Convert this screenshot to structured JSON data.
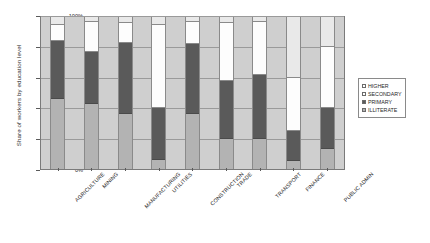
{
  "chart_data": {
    "type": "bar",
    "subtype": "stacked-percentage",
    "title": "",
    "xlabel": "",
    "ylabel": "Share of workers by education level",
    "ylim": [
      0,
      100
    ],
    "yticks": [
      "0%",
      "20%",
      "40%",
      "60%",
      "80%",
      "100%"
    ],
    "grid": true,
    "legend_position": "right",
    "categories": [
      "AGRICULTURE",
      "MINING",
      "MANUFACTURING",
      "UTILITIES",
      "CONSTRUCTION",
      "TRADE",
      "TRANSPORT",
      "FINANCE",
      "PUBLIC ADMIN"
    ],
    "series": [
      {
        "name": "ILLITERATE",
        "color": "#b3b3b3",
        "values": [
          46,
          43,
          36,
          6,
          36,
          20,
          20,
          5,
          13
        ]
      },
      {
        "name": "PRIMARY",
        "color": "#5a5a5a",
        "values": [
          38,
          34,
          47,
          34,
          46,
          38,
          42,
          20,
          27
        ]
      },
      {
        "name": "SECONDARY",
        "color": "#fdfdfd",
        "values": [
          11,
          20,
          13,
          55,
          15,
          38,
          35,
          35,
          40
        ]
      },
      {
        "name": "HIGHER",
        "color": "#e9e9e9",
        "values": [
          5,
          3,
          4,
          5,
          3,
          4,
          3,
          40,
          20
        ]
      }
    ]
  },
  "legend": {
    "items": [
      {
        "label": "HIGHER",
        "swatch": "higher"
      },
      {
        "label": "SECONDARY",
        "swatch": "secondary"
      },
      {
        "label": "PRIMARY",
        "swatch": "primary"
      },
      {
        "label": "ILLITERATE",
        "swatch": "illiterate"
      }
    ]
  }
}
